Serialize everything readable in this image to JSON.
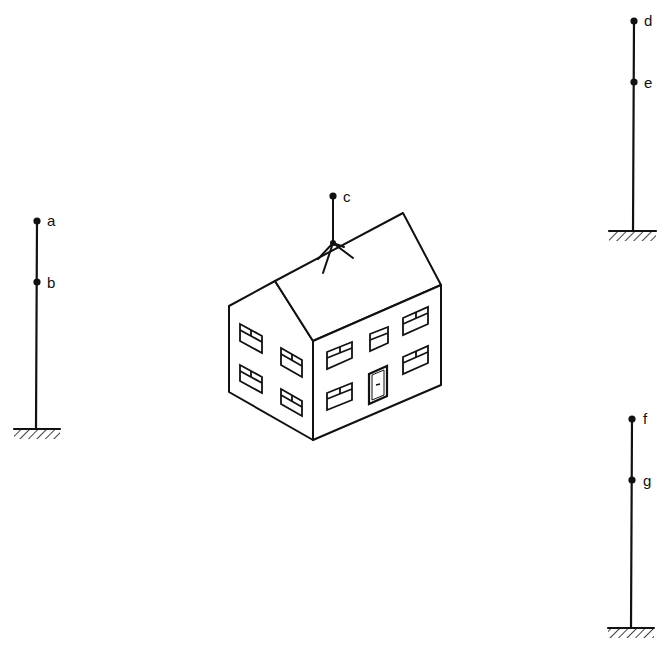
{
  "diagram": {
    "type": "scene-illustration",
    "colors": {
      "ink": "#111111",
      "background": "#ffffff"
    },
    "points": [
      {
        "id": "a",
        "label": "a",
        "location": "top of left pole"
      },
      {
        "id": "b",
        "label": "b",
        "location": "upper part of left pole"
      },
      {
        "id": "c",
        "label": "c",
        "location": "top of antenna on house roof"
      },
      {
        "id": "d",
        "label": "d",
        "location": "top of upper-right pole"
      },
      {
        "id": "e",
        "label": "e",
        "location": "upper part of upper-right pole"
      },
      {
        "id": "f",
        "label": "f",
        "location": "top of lower-right pole"
      },
      {
        "id": "g",
        "label": "g",
        "location": "upper part of lower-right pole"
      }
    ],
    "objects": [
      {
        "name": "left-pole",
        "points": [
          "a",
          "b"
        ],
        "grounded": true
      },
      {
        "name": "upper-right-pole",
        "points": [
          "d",
          "e"
        ],
        "grounded": true
      },
      {
        "name": "lower-right-pole",
        "points": [
          "f",
          "g"
        ],
        "grounded": true
      },
      {
        "name": "house",
        "floors": 2,
        "gable_windows": 4,
        "front_windows": 5,
        "doors": 1
      },
      {
        "name": "antenna",
        "on": "house-roof",
        "points": [
          "c"
        ]
      }
    ]
  }
}
